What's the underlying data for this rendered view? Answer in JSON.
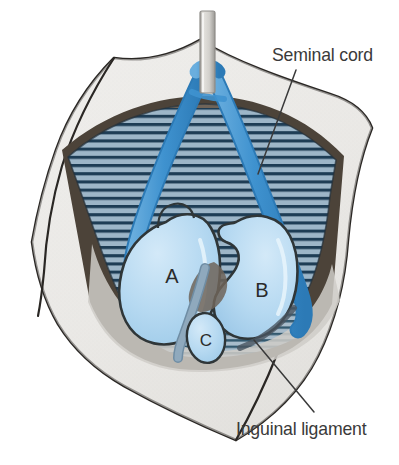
{
  "figure": {
    "type": "anatomical-illustration",
    "background_color": "#ffffff",
    "width": 399,
    "height": 465
  },
  "labels": {
    "seminal_cord": "Seminal cord",
    "inguinal_ligament": "Inguinal ligament",
    "label_color": "#3a3a3a"
  },
  "structures": [
    {
      "key": "A",
      "letter": "A",
      "description": "Large rounded teardrop structure, left of midline",
      "fill": "#b4d8f0"
    },
    {
      "key": "B",
      "letter": "B",
      "description": "Kidney/bean-shaped structure, right of midline",
      "fill": "#b4d8f0"
    },
    {
      "key": "C",
      "letter": "C",
      "description": "Small oval structure, inferior midline",
      "fill": "#b4d8f0"
    }
  ],
  "colors": {
    "structure_fill": "#b4d8f0",
    "structure_fill_light": "#c9e4f6",
    "structure_outline": "#2f3638",
    "cord_blue": "#3f92cf",
    "cord_blue_dark": "#2f7ab5",
    "muscle_base": "#9fb4c4",
    "muscle_stripe": "#1d3c52",
    "muscle_shadow": "#6f6459",
    "drape_fill": "#eceae7",
    "drape_fill_shade": "#dedad6",
    "drape_outline": "#2a2724",
    "dark_cavity": "#4c4339",
    "tube_grey": "#d6d4d0",
    "tube_grey_edge": "#8f8d89",
    "vessel_grey_blue": "#8fa9bd",
    "leader_line": "#3a3a3a"
  },
  "leader_lines": [
    {
      "name": "seminal-cord-leader",
      "x1": 296,
      "y1": 70,
      "x2": 258,
      "y2": 174
    },
    {
      "name": "inguinal-ligament-leader",
      "x1": 254,
      "y1": 340,
      "x2": 314,
      "y2": 412
    }
  ]
}
